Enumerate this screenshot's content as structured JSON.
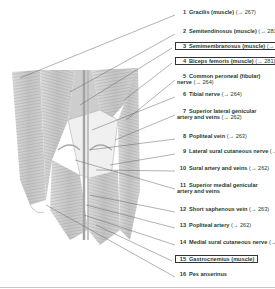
{
  "figure": {
    "labels": [
      {
        "num": "1",
        "name": "Gracilis (muscle)",
        "ref": "(→ 267)",
        "boxed": false,
        "y": 12
      },
      {
        "num": "2",
        "name": "Semitendinosus (muscle)",
        "ref": "(→ 281)",
        "boxed": false,
        "y": 31
      },
      {
        "num": "3",
        "name": "Semimembranosus (muscle)",
        "ref": "(→ 281)",
        "boxed": true,
        "y": 45
      },
      {
        "num": "4",
        "name": "Biceps femoris (muscle)",
        "ref": "(→ 281)",
        "boxed": true,
        "y": 60
      },
      {
        "num": "5",
        "name": "Common peroneal (fibular) nerve",
        "ref": "(→ 264)",
        "boxed": false,
        "y": 76,
        "wrap": true
      },
      {
        "num": "6",
        "name": "Tibial nerve",
        "ref": "(→ 264)",
        "boxed": false,
        "y": 94
      },
      {
        "num": "7",
        "name": "Superior lateral genicular artery and veins",
        "ref": "(→ 262)",
        "boxed": false,
        "y": 111,
        "wrap": true
      },
      {
        "num": "8",
        "name": "Popliteal vein",
        "ref": "(→ 263)",
        "boxed": false,
        "y": 136
      },
      {
        "num": "9",
        "name": "Lateral sural cutaneous nerve",
        "ref": "(→ 301)",
        "boxed": false,
        "y": 151
      },
      {
        "num": "10",
        "name": "Sural artery and veins",
        "ref": "(→ 262)",
        "boxed": false,
        "y": 168
      },
      {
        "num": "11",
        "name": "Superior medial genicular artery and veins",
        "ref": "",
        "boxed": false,
        "y": 185,
        "wrap": true
      },
      {
        "num": "12",
        "name": "Short saphenous vein",
        "ref": "(→ 263)",
        "boxed": false,
        "y": 209
      },
      {
        "num": "13",
        "name": "Popliteal artery",
        "ref": "(→ 262)",
        "boxed": false,
        "y": 225
      },
      {
        "num": "14",
        "name": "Medial sural cutaneous nerve",
        "ref": "(→ 301)",
        "boxed": false,
        "y": 242
      },
      {
        "num": "15",
        "name": "Gastrocnemius (muscle)",
        "ref": "",
        "boxed": true,
        "y": 258
      },
      {
        "num": "16",
        "name": "Pes anserinus",
        "ref": "",
        "boxed": false,
        "y": 274
      }
    ]
  }
}
